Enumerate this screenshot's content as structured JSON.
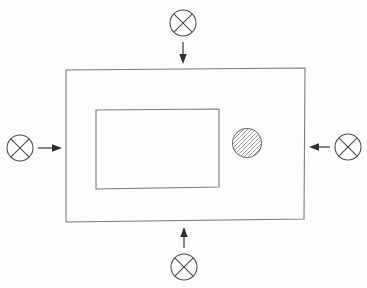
{
  "diagram": {
    "background_color": "#fdfdfc",
    "line_color": "#7c7c7c",
    "glyph_color": "#4a4a4a",
    "arrow_color": "#2e2e2e",
    "hatch_color": "#8a8a8a",
    "outer_plate": {
      "label": "outer-plate",
      "corners": [
        [
          66,
          70
        ],
        [
          305,
          68
        ],
        [
          304,
          219
        ],
        [
          66,
          222
        ]
      ]
    },
    "inner_cutout": {
      "label": "inner-cutout",
      "corners": [
        [
          96,
          110
        ],
        [
          219,
          109
        ],
        [
          219,
          187
        ],
        [
          96,
          189
        ]
      ]
    },
    "hatched_hole": {
      "label": "hatched-circular-hole",
      "center": [
        247,
        143
      ],
      "radius": 14.5,
      "hatch_angle_deg": 45,
      "hatch_spacing": 4
    },
    "load_markers": [
      {
        "name": "load-marker-top",
        "position": "top",
        "circle_center": [
          183,
          23
        ],
        "circle_radius": 13,
        "arrow": {
          "from": [
            183,
            42
          ],
          "to": [
            183,
            64
          ],
          "direction": "down"
        }
      },
      {
        "name": "load-marker-left",
        "position": "left",
        "circle_center": [
          20,
          148
        ],
        "circle_radius": 13,
        "arrow": {
          "from": [
            38,
            148
          ],
          "to": [
            62,
            148
          ],
          "direction": "right"
        }
      },
      {
        "name": "load-marker-right",
        "position": "right",
        "circle_center": [
          348,
          147
        ],
        "circle_radius": 13,
        "arrow": {
          "from": [
            330,
            147
          ],
          "to": [
            309,
            147
          ],
          "direction": "left"
        }
      },
      {
        "name": "load-marker-bottom",
        "position": "bottom",
        "circle_center": [
          184,
          267
        ],
        "circle_radius": 13,
        "arrow": {
          "from": [
            184,
            248
          ],
          "to": [
            184,
            227
          ],
          "direction": "up"
        }
      }
    ]
  }
}
